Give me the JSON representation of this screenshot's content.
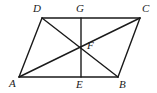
{
  "figure": {
    "name": "parallelogram-with-diagonals",
    "background_color": "#ffffff",
    "stroke_color": "#1a1a1a",
    "stroke_width": 1.4,
    "width": 157,
    "height": 93
  },
  "points": [
    {
      "id": "A",
      "label": "A",
      "x": 19,
      "y": 77,
      "label_x": 9,
      "label_y": 78
    },
    {
      "id": "B",
      "label": "B",
      "x": 118,
      "y": 77,
      "label_x": 119,
      "label_y": 79
    },
    {
      "id": "C",
      "label": "C",
      "x": 140,
      "y": 18,
      "label_x": 142,
      "label_y": 3
    },
    {
      "id": "D",
      "label": "D",
      "x": 42,
      "y": 18,
      "label_x": 33,
      "label_y": 3
    },
    {
      "id": "E",
      "label": "E",
      "x": 81,
      "y": 77,
      "label_x": 76,
      "label_y": 79
    },
    {
      "id": "F",
      "label": "F",
      "x": 81,
      "y": 47,
      "label_x": 87,
      "label_y": 40
    },
    {
      "id": "G",
      "label": "G",
      "x": 81,
      "y": 18,
      "label_x": 76,
      "label_y": 3
    }
  ],
  "segments": [
    {
      "id": "DC",
      "from": "D",
      "to": "C",
      "role": "top-side"
    },
    {
      "id": "AB",
      "from": "A",
      "to": "B",
      "role": "bottom-side"
    },
    {
      "id": "AD",
      "from": "A",
      "to": "D",
      "role": "left-side"
    },
    {
      "id": "BC",
      "from": "B",
      "to": "C",
      "role": "right-side"
    },
    {
      "id": "AC",
      "from": "A",
      "to": "C",
      "role": "diagonal"
    },
    {
      "id": "DB",
      "from": "D",
      "to": "B",
      "role": "diagonal"
    },
    {
      "id": "GE",
      "from": "G",
      "to": "E",
      "role": "midsegment"
    }
  ]
}
